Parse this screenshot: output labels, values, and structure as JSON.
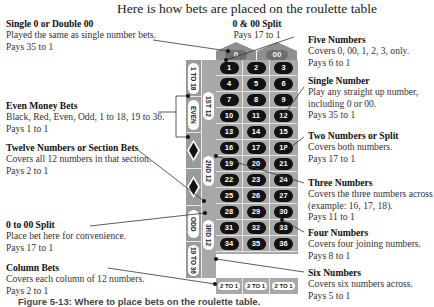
{
  "title": "Here is how bets are placed on the roulette table",
  "caption": "Figure 5-13: Where to place bets on the roulette table.",
  "annotations_left": [
    {
      "heading": "Single 0 or Double 00",
      "lines": [
        "Played the same as single number bets.",
        "Pays 35 to 1"
      ]
    },
    {
      "heading": "Even Money Bets",
      "lines": [
        "Black, Red, Even, Odd, 1 to 18, 19 to 36.",
        "Pays 1 to 1"
      ]
    },
    {
      "heading": "Twelve Numbers or Section Bets",
      "lines": [
        "Covers all 12 numbers in that section.",
        "Pays 2 to 1"
      ]
    },
    {
      "heading": "0 to 00 Split",
      "lines": [
        "Place bet here for convenience.",
        "Pays 17 to 1"
      ]
    },
    {
      "heading": "Column Bets",
      "lines": [
        "Covers each column of 12 numbers.",
        "Pays 2 to 1"
      ]
    }
  ],
  "annotation_top": {
    "heading": "0 & 00 Split",
    "lines": [
      "Pays 17 to 1"
    ]
  },
  "annotations_right": [
    {
      "heading": "Five Numbers",
      "lines": [
        "Covers 0, 00, 1, 2, 3, only.",
        "Pays 6 to 1"
      ]
    },
    {
      "heading": "Single Number",
      "lines": [
        "Play any straight up number,",
        "including 0 or 00.",
        "Pays 35 to 1"
      ]
    },
    {
      "heading": "Two Numbers or Split",
      "lines": [
        "Covers both numbers.",
        "Pays 17 to 1"
      ]
    },
    {
      "heading": "Three Numbers",
      "lines": [
        "Covers the three numbers across",
        "(example: 16, 17, 18).",
        "Pays 11 to 1"
      ]
    },
    {
      "heading": "Four Numbers",
      "lines": [
        "Covers four joining numbers.",
        "Pays 8 to 1"
      ]
    },
    {
      "heading": "Six Numbers",
      "lines": [
        "Covers six numbers across.",
        "Pays 5 to 1"
      ]
    }
  ],
  "table": {
    "zeros": [
      "0",
      "00"
    ],
    "outside": [
      {
        "type": "text",
        "label": "1 TO 18"
      },
      {
        "type": "text",
        "label": "EVEN"
      },
      {
        "type": "diamond",
        "label": "red-diamond"
      },
      {
        "type": "diamond",
        "label": "black-diamond"
      },
      {
        "type": "text",
        "label": "ODD"
      },
      {
        "type": "text",
        "label": "19 TO 36"
      }
    ],
    "dozens": [
      "1ST 12",
      "2ND 12",
      "3RD 12"
    ],
    "numbers": [
      [
        "1",
        "2",
        "3"
      ],
      [
        "4",
        "5",
        "6"
      ],
      [
        "7",
        "8",
        "9"
      ],
      [
        "10",
        "11",
        "12"
      ],
      [
        "13",
        "14",
        "15"
      ],
      [
        "16",
        "17",
        "18"
      ],
      [
        "19",
        "20",
        "21"
      ],
      [
        "22",
        "23",
        "24"
      ],
      [
        "25",
        "26",
        "27"
      ],
      [
        "28",
        "29",
        "30"
      ],
      [
        "31",
        "32",
        "33"
      ],
      [
        "34",
        "35",
        "36"
      ]
    ],
    "columns": [
      "2 TO 1",
      "2 TO 1",
      "2 TO 1"
    ]
  },
  "colors": {
    "table_gray": "#a9a9a9",
    "chip_black": "#111111",
    "divider": "#e6e6e6"
  }
}
